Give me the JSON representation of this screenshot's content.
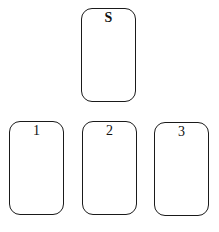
{
  "diagram": {
    "top_row": [
      {
        "id": "S",
        "label": "S"
      }
    ],
    "bottom_row": [
      {
        "id": "1",
        "label": "1"
      },
      {
        "id": "2",
        "label": "2"
      },
      {
        "id": "3",
        "label": "3"
      }
    ]
  },
  "colors": {
    "stroke": "#1a1a1a",
    "background": "#ffffff",
    "text": "#111111"
  }
}
